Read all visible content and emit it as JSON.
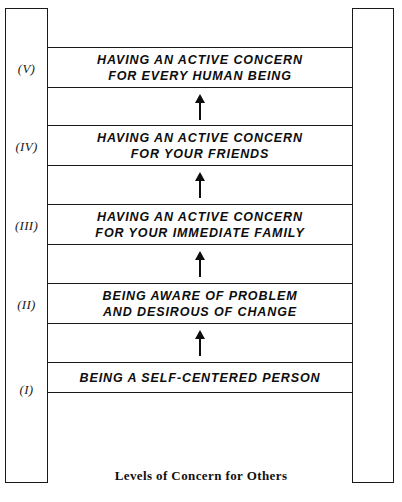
{
  "figure": {
    "caption": "Levels of Concern for Others",
    "colors": {
      "ink": "#1a1a1a",
      "background": "#ffffff",
      "arrow": "#0d0d0d"
    },
    "levels": [
      {
        "numeral": "(V)",
        "text": "HAVING AN ACTIVE CONCERN\nFOR EVERY HUMAN BEING",
        "lines": 2
      },
      {
        "numeral": "(IV)",
        "text": "HAVING AN ACTIVE CONCERN\nFOR YOUR FRIENDS",
        "lines": 2
      },
      {
        "numeral": "(III)",
        "text": "HAVING AN ACTIVE CONCERN\nFOR YOUR IMMEDIATE FAMILY",
        "lines": 2
      },
      {
        "numeral": "(II)",
        "text": "BEING AWARE OF PROBLEM\nAND DESIROUS OF CHANGE",
        "lines": 2
      },
      {
        "numeral": "(I)",
        "text": "BEING A SELF-CENTERED PERSON",
        "lines": 1
      }
    ],
    "arrows": {
      "count": 4,
      "direction": "up",
      "icon": "arrow-up-icon"
    }
  }
}
